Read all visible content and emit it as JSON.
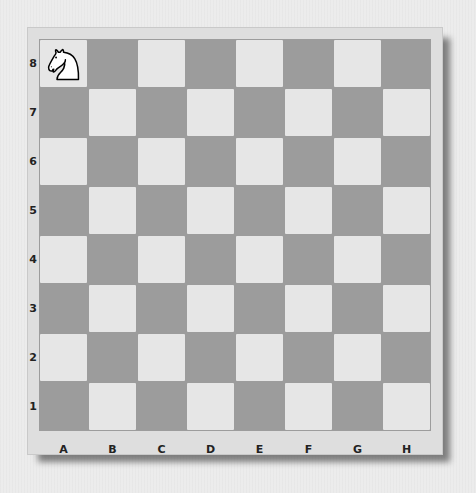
{
  "board": {
    "ranks": [
      "8",
      "7",
      "6",
      "5",
      "4",
      "3",
      "2",
      "1"
    ],
    "files": [
      "A",
      "B",
      "C",
      "D",
      "E",
      "F",
      "G",
      "H"
    ],
    "colors": {
      "light": "#e6e6e6",
      "dark": "#9c9c9c",
      "frame": "#dedede"
    },
    "pieces": [
      {
        "square": "a8",
        "type": "knight",
        "color": "white",
        "icon": "white-knight-icon"
      }
    ]
  }
}
